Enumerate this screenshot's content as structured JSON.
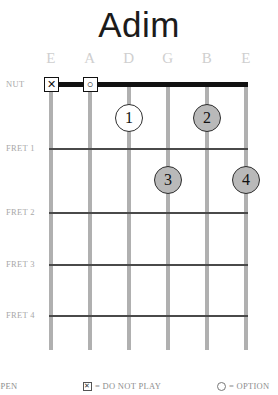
{
  "title": "Adim",
  "colors": {
    "nut": "#111111",
    "fret_line": "#4a4a4a",
    "string": "#b0b0b0",
    "label_gray": "#a8a8a8",
    "string_label_gray": "#cfcfcf",
    "dot_filled": "#b9b9b9",
    "dot_open": "#ffffff",
    "background": "#ffffff"
  },
  "strings": [
    {
      "label": "E",
      "x": 51
    },
    {
      "label": "A",
      "x": 90
    },
    {
      "label": "D",
      "x": 129
    },
    {
      "label": "G",
      "x": 168
    },
    {
      "label": "B",
      "x": 207
    },
    {
      "label": "E",
      "x": 246
    }
  ],
  "frets": [
    {
      "label": "NUT",
      "y": 84
    },
    {
      "label": "FRET 1",
      "y": 148
    },
    {
      "label": "FRET 2",
      "y": 212
    },
    {
      "label": "FRET 3",
      "y": 264
    },
    {
      "label": "FRET 4",
      "y": 315
    }
  ],
  "nut_markers": [
    {
      "symbol": "✕",
      "string": "E",
      "x": 51,
      "meaning": "do-not-play"
    },
    {
      "symbol": "○",
      "string": "A",
      "x": 90,
      "meaning": "optional"
    }
  ],
  "finger_dots": [
    {
      "finger": "1",
      "string": "D",
      "x": 129,
      "y": 118,
      "fret": "NUT",
      "style": "open"
    },
    {
      "finger": "2",
      "string": "B",
      "x": 207,
      "y": 118,
      "fret": "NUT",
      "style": "filled"
    },
    {
      "finger": "3",
      "string": "G",
      "x": 168,
      "y": 180,
      "fret": "1",
      "style": "filled"
    },
    {
      "finger": "4",
      "string": "E",
      "x": 246,
      "y": 180,
      "fret": "1",
      "style": "filled"
    }
  ],
  "legend": [
    {
      "id": "open",
      "glyph": "none",
      "text": "OPEN",
      "x": -6
    },
    {
      "id": "do-not-play",
      "glyph": "box-x",
      "text": "= DO NOT PLAY",
      "x": 83
    },
    {
      "id": "optional",
      "glyph": "circle",
      "text": "= OPTION",
      "x": 217
    }
  ]
}
